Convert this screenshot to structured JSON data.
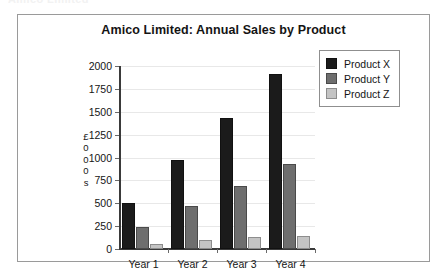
{
  "clipped_heading": "Amico Limited",
  "chart_data": {
    "type": "bar",
    "title": "Amico Limited: Annual Sales by Product",
    "xlabel": "",
    "ylabel": "£000s",
    "ylabel_stacked": [
      "£",
      "0",
      "0",
      "0",
      "s"
    ],
    "categories": [
      "Year 1",
      "Year 2",
      "Year 3",
      "Year 4"
    ],
    "series": [
      {
        "name": "Product X",
        "color": "#1b1b1b",
        "values": [
          500,
          970,
          1430,
          1915
        ]
      },
      {
        "name": "Product Y",
        "color": "#6e6e6e",
        "values": [
          245,
          465,
          685,
          930
        ]
      },
      {
        "name": "Product Z",
        "color": "#c4c4c4",
        "values": [
          55,
          95,
          130,
          145
        ]
      }
    ],
    "ylim": [
      0,
      2000
    ],
    "ytick_step": 250,
    "yticks": [
      0,
      250,
      500,
      750,
      1000,
      1250,
      1500,
      1750,
      2000
    ],
    "ytick_labels": [
      "0",
      "250",
      "500",
      "750",
      "1000",
      "1250",
      "1500",
      "1750",
      "2000"
    ],
    "grid": true,
    "grid_color": "#e8e8e8",
    "legend_position": "top-right",
    "frame_border_color": "#9a9a9a",
    "background": "#ffffff"
  }
}
